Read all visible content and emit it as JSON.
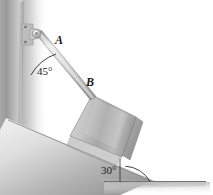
{
  "figure": {
    "kind": "statics-free-body-diagram",
    "background_color": "#ffffff",
    "labels": {
      "point_a": "A",
      "point_b": "B",
      "angle_wall": "45°",
      "angle_incline": "30°"
    },
    "annotations": {
      "wall_angle_value": 45,
      "incline_angle_value": 30,
      "degree_symbol": "°"
    },
    "colors": {
      "ink": "#1a1a1a",
      "wall_dark": "#8d8d8d",
      "wall_light": "#f2f2f2",
      "incline_light": "#e2e2e2",
      "incline_dark": "#8a8a8a",
      "plate_light": "#dcdcdc",
      "plate_mid": "#b4b4b4",
      "plate_dark": "#909090",
      "rod_light": "#e6e6e6",
      "rod_dark": "#9a9a9a",
      "ground_shadow": "#c9c9c9",
      "outline": "#6b6b6b"
    },
    "parts": {
      "wall": "vertical-wall",
      "rod": "rod-ab",
      "pivot": "wall-bracket-pin",
      "plate": "rectangular-plate",
      "incline": "inclined-ground-surface",
      "ground": "horizontal-ground-line",
      "arc_45": "angle-arc-45",
      "arc_30": "angle-arc-30"
    }
  }
}
